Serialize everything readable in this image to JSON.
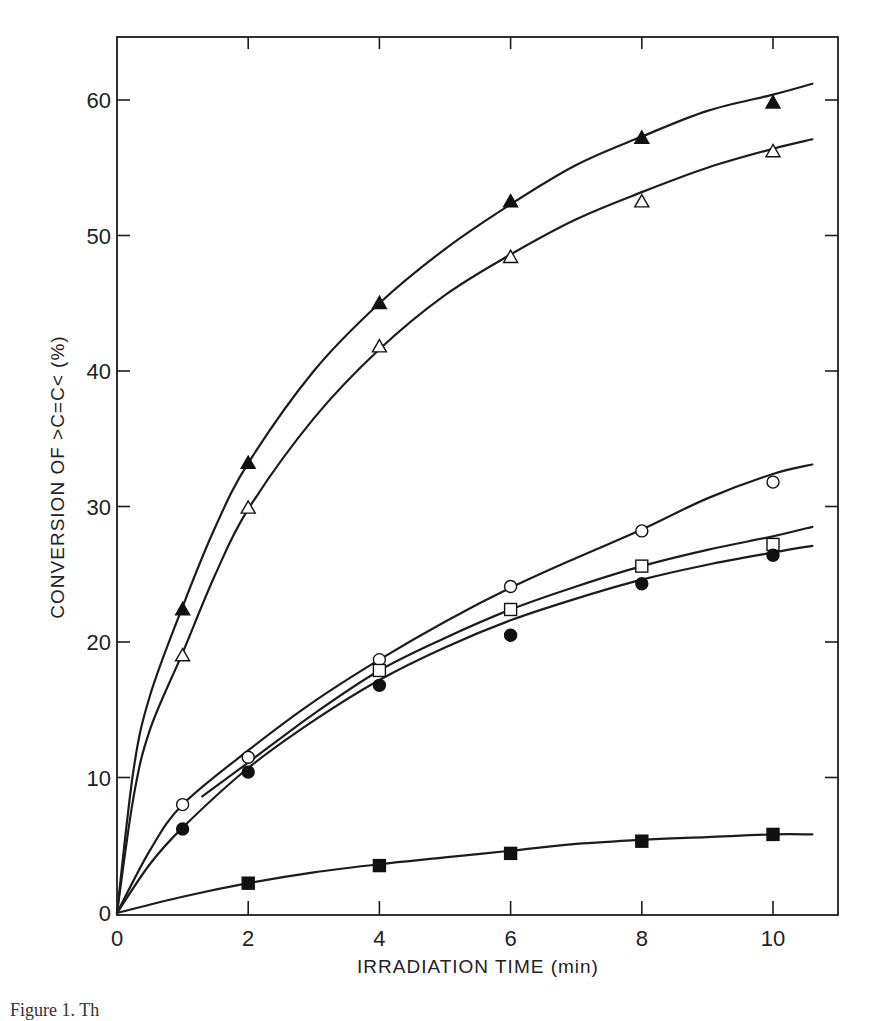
{
  "chart_data": {
    "type": "line",
    "title": "",
    "xlabel": "IRRADIATION TIME (min)",
    "ylabel": "CONVERSION OF >C=C< (%)",
    "xlim": [
      0,
      11.0
    ],
    "ylim": [
      0,
      65
    ],
    "x_ticks": [
      0,
      2,
      4,
      6,
      8,
      10
    ],
    "x_tick_labels": [
      "0",
      "2",
      "4",
      "6",
      "8",
      "10"
    ],
    "y_ticks": [
      0,
      10,
      20,
      30,
      40,
      50,
      60
    ],
    "y_tick_labels": [
      "0",
      "10",
      "20",
      "30",
      "40",
      "50",
      "60"
    ],
    "grid": false,
    "legend": null,
    "series": [
      {
        "name": "filled triangles",
        "marker": "triangle-filled",
        "points": [
          [
            0,
            0
          ],
          [
            1,
            22.4
          ],
          [
            2,
            33.2
          ],
          [
            4,
            45.0
          ],
          [
            6,
            52.5
          ],
          [
            8,
            57.2
          ],
          [
            10,
            59.8
          ]
        ],
        "curve": [
          [
            0,
            0
          ],
          [
            0.25,
            10.5
          ],
          [
            0.5,
            16.0
          ],
          [
            1,
            22.6
          ],
          [
            1.5,
            28.5
          ],
          [
            2,
            33.2
          ],
          [
            3,
            40.0
          ],
          [
            4,
            45.0
          ],
          [
            5,
            49.0
          ],
          [
            6,
            52.3
          ],
          [
            7,
            55.2
          ],
          [
            8,
            57.3
          ],
          [
            9,
            59.2
          ],
          [
            10,
            60.4
          ],
          [
            10.6,
            61.2
          ]
        ]
      },
      {
        "name": "open triangles",
        "marker": "triangle-open",
        "points": [
          [
            0,
            0
          ],
          [
            1,
            19.0
          ],
          [
            2,
            29.9
          ],
          [
            4,
            41.8
          ],
          [
            6,
            48.4
          ],
          [
            8,
            52.5
          ],
          [
            10,
            56.2
          ]
        ],
        "curve": [
          [
            0,
            0
          ],
          [
            0.25,
            8.5
          ],
          [
            0.5,
            13.5
          ],
          [
            1,
            19.2
          ],
          [
            1.5,
            25.0
          ],
          [
            2,
            29.8
          ],
          [
            3,
            36.5
          ],
          [
            4,
            41.6
          ],
          [
            5,
            45.6
          ],
          [
            6,
            48.6
          ],
          [
            7,
            51.2
          ],
          [
            8,
            53.2
          ],
          [
            9,
            55.0
          ],
          [
            10,
            56.4
          ],
          [
            10.6,
            57.1
          ]
        ]
      },
      {
        "name": "open circles",
        "marker": "circle-open",
        "points": [
          [
            0,
            0
          ],
          [
            1,
            8.0
          ],
          [
            2,
            11.5
          ],
          [
            4,
            18.7
          ],
          [
            6,
            24.1
          ],
          [
            8,
            28.2
          ],
          [
            10,
            31.8
          ]
        ],
        "curve": [
          [
            0,
            0
          ],
          [
            0.5,
            4.6
          ],
          [
            1,
            8.0
          ],
          [
            2,
            12.0
          ],
          [
            3,
            15.6
          ],
          [
            4,
            18.7
          ],
          [
            5,
            21.5
          ],
          [
            6,
            24.0
          ],
          [
            7,
            26.2
          ],
          [
            8,
            28.3
          ],
          [
            9,
            30.6
          ],
          [
            10,
            32.4
          ],
          [
            10.6,
            33.1
          ]
        ]
      },
      {
        "name": "open squares",
        "marker": "square-open",
        "points": [
          [
            4,
            17.9
          ],
          [
            6,
            22.4
          ],
          [
            8,
            25.6
          ],
          [
            10,
            27.2
          ]
        ],
        "curve": [
          [
            1.3,
            8.6
          ],
          [
            2,
            11.1
          ],
          [
            3,
            14.7
          ],
          [
            4,
            17.9
          ],
          [
            5,
            20.3
          ],
          [
            6,
            22.4
          ],
          [
            7,
            24.1
          ],
          [
            8,
            25.6
          ],
          [
            9,
            26.8
          ],
          [
            10,
            27.8
          ],
          [
            10.6,
            28.5
          ]
        ]
      },
      {
        "name": "filled circles",
        "marker": "circle-filled",
        "points": [
          [
            0,
            0
          ],
          [
            1,
            6.2
          ],
          [
            2,
            10.4
          ],
          [
            4,
            16.8
          ],
          [
            6,
            20.5
          ],
          [
            8,
            24.3
          ],
          [
            10,
            26.4
          ]
        ],
        "curve": [
          [
            0,
            0
          ],
          [
            0.5,
            3.6
          ],
          [
            1,
            6.3
          ],
          [
            2,
            10.7
          ],
          [
            3,
            14.2
          ],
          [
            4,
            17.2
          ],
          [
            5,
            19.6
          ],
          [
            6,
            21.6
          ],
          [
            7,
            23.2
          ],
          [
            8,
            24.6
          ],
          [
            9,
            25.7
          ],
          [
            10,
            26.6
          ],
          [
            10.6,
            27.1
          ]
        ]
      },
      {
        "name": "filled squares",
        "marker": "square-filled",
        "points": [
          [
            0,
            0
          ],
          [
            2,
            2.2
          ],
          [
            4,
            3.5
          ],
          [
            6,
            4.4
          ],
          [
            8,
            5.3
          ],
          [
            10,
            5.8
          ]
        ],
        "curve": [
          [
            0,
            0
          ],
          [
            1,
            1.2
          ],
          [
            2,
            2.2
          ],
          [
            3,
            3.0
          ],
          [
            4,
            3.6
          ],
          [
            5,
            4.1
          ],
          [
            6,
            4.6
          ],
          [
            7,
            5.1
          ],
          [
            8,
            5.4
          ],
          [
            9,
            5.6
          ],
          [
            10,
            5.8
          ],
          [
            10.6,
            5.8
          ]
        ]
      }
    ]
  },
  "figure": {
    "x_axis_title": "IRRADIATION TIME (min)",
    "y_axis_title": "CONVERSION OF >C=C< (%)",
    "caption_fragment": "Figure 1.  Th"
  }
}
